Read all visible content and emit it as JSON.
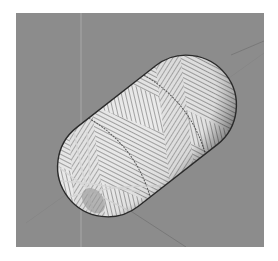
{
  "image": {
    "subject": "filament-wound capsule pressure vessel",
    "background_color": "#8c8c8c",
    "page_color": "#ffffff",
    "vessel_color": "#e6e6e6",
    "fiber_line_color": "#6e6e6e",
    "outline_color": "#2a2a2a"
  }
}
